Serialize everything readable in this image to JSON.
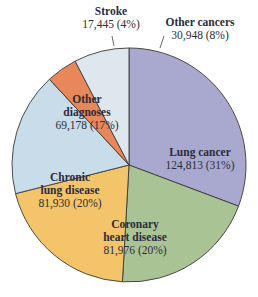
{
  "chart_data": {
    "type": "pie",
    "title": "",
    "slices": [
      {
        "label": "Lung cancer",
        "value": 124813,
        "percent": 31,
        "color": "#a9a9cf",
        "name_lines": [
          "Lung cancer"
        ],
        "value_text": "124,813 (31%)"
      },
      {
        "label": "Coronary heart disease",
        "value": 81976,
        "percent": 20,
        "color": "#a9c394",
        "name_lines": [
          "Coronary",
          "heart disease"
        ],
        "value_text": "81,976 (20%)"
      },
      {
        "label": "Chronic lung disease",
        "value": 81930,
        "percent": 20,
        "color": "#f3c46a",
        "name_lines": [
          "Chronic",
          "lung disease"
        ],
        "value_text": "81,930 (20%)"
      },
      {
        "label": "Other diagnoses",
        "value": 69178,
        "percent": 17,
        "color": "#c9dcea",
        "name_lines": [
          "Other",
          "diagnoses"
        ],
        "value_text": "69,178 (17%)"
      },
      {
        "label": "Stroke",
        "value": 17445,
        "percent": 4,
        "color": "#e8875a",
        "name_lines": [
          "Stroke"
        ],
        "value_text": "17,445 (4%)"
      },
      {
        "label": "Other cancers",
        "value": 30948,
        "percent": 8,
        "color": "#dfe7ee",
        "name_lines": [
          "Other cancers"
        ],
        "value_text": "30,948 (8%)"
      }
    ],
    "start_angle_deg": 0,
    "direction": "clockwise",
    "legend": "none (inline labels)"
  },
  "labels": {
    "lung_cancer": {
      "name": "Lung cancer",
      "val": "124,813 (31%)"
    },
    "coronary": {
      "name1": "Coronary",
      "name2": "heart disease",
      "val": "81,976 (20%)"
    },
    "chronic": {
      "name1": "Chronic",
      "name2": "lung disease",
      "val": "81,930 (20%)"
    },
    "other_diag": {
      "name1": "Other",
      "name2": "diagnoses",
      "val": "69,178 (17%)"
    },
    "stroke": {
      "name": "Stroke",
      "val": "17,445 (4%)"
    },
    "other_cancers": {
      "name": "Other cancers",
      "val": "30,948 (8%)"
    }
  }
}
